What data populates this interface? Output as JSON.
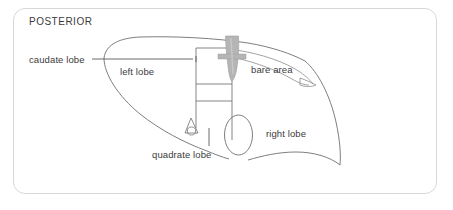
{
  "figure": {
    "orientation_label": "POSTERIOR",
    "background_color": "#ffffff",
    "border_color": "#d8d8d8",
    "outline_color": "#6f6f6f",
    "vessel_color": "#b5b5b5",
    "text_color": "#3b3b3b",
    "leader_color": "#5a5a5a"
  },
  "labels": {
    "caudate_lobe": "caudate lobe",
    "left_lobe": "left lobe",
    "bare_area": "bare area",
    "right_lobe": "right lobe",
    "quadrate_lobe": "quadrate lobe"
  },
  "structures": {
    "liver_outline": "liver-posterior-outline",
    "inferior_vena_cava": "inferior-vena-cava",
    "gallbladder": "gallbladder",
    "ligament_triangle": "ligament-attachment",
    "caudate_box": "caudate-lobe-box",
    "quadrate_box": "quadrate-lobe-box",
    "bare_area_notch": "bare-area-notch"
  }
}
